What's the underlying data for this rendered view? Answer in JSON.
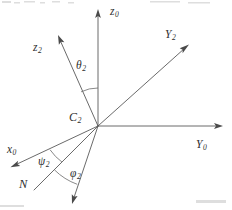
{
  "figure": {
    "kind": "euler-angle-coordinate-frame-diagram",
    "background_color": "#ffffff",
    "line_color": "#595959",
    "text_color": "#2e2e2e",
    "width": 232,
    "height": 210,
    "origin": {
      "x": 98,
      "y": 126,
      "label": "C",
      "subscript": "2"
    }
  },
  "labels": {
    "z0": {
      "base": "z",
      "sub": "0"
    },
    "z2": {
      "base": "z",
      "sub": "2"
    },
    "y0": {
      "base": "Y",
      "sub": "0"
    },
    "y2": {
      "base": "Y",
      "sub": "2"
    },
    "x0": {
      "base": "x",
      "sub": "0"
    },
    "c2": {
      "base": "C",
      "sub": "2"
    },
    "n": {
      "base": "N",
      "sub": ""
    },
    "theta2": {
      "base": "θ",
      "sub": "2"
    },
    "psi2": {
      "base": "ψ",
      "sub": "2"
    },
    "phi2": {
      "base": "φ",
      "sub": "2"
    }
  },
  "axes": [
    {
      "name": "z0",
      "from": [
        98,
        126
      ],
      "to": [
        98,
        12
      ],
      "arrow": true
    },
    {
      "name": "y0",
      "from": [
        98,
        126
      ],
      "to": [
        222,
        126
      ],
      "arrow": true
    },
    {
      "name": "x0",
      "from": [
        98,
        126
      ],
      "to": [
        12,
        167
      ],
      "arrow": true
    },
    {
      "name": "y2",
      "from": [
        98,
        126
      ],
      "to": [
        188,
        45
      ],
      "arrow": true
    },
    {
      "name": "z2",
      "from": [
        98,
        126
      ],
      "to": [
        58,
        36
      ],
      "arrow": true
    },
    {
      "name": "n",
      "from": [
        98,
        126
      ],
      "to": [
        34,
        190
      ],
      "arrow": false
    },
    {
      "name": "x2",
      "from": [
        98,
        126
      ],
      "to": [
        72,
        203
      ],
      "arrow": true
    }
  ],
  "arcs": [
    {
      "name": "theta2",
      "between": [
        "z0",
        "z2"
      ],
      "radius": 38
    },
    {
      "name": "psi2",
      "between": [
        "x0",
        "n"
      ],
      "radius": 52
    },
    {
      "name": "phi2",
      "between": [
        "n",
        "x2"
      ],
      "radius": 62
    }
  ]
}
